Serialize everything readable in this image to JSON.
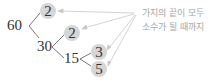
{
  "diagram": {
    "type": "factor-tree",
    "root": "60",
    "nodes": [
      {
        "id": "n60",
        "value": "60",
        "prime": false
      },
      {
        "id": "n2a",
        "value": "2",
        "prime": true,
        "parent": "n60"
      },
      {
        "id": "n30",
        "value": "30",
        "prime": false,
        "parent": "n60"
      },
      {
        "id": "n2b",
        "value": "2",
        "prime": true,
        "parent": "n30"
      },
      {
        "id": "n15",
        "value": "15",
        "prime": false,
        "parent": "n30"
      },
      {
        "id": "n3",
        "value": "3",
        "prime": true,
        "parent": "n15"
      },
      {
        "id": "n5",
        "value": "5",
        "prime": true,
        "parent": "n15"
      }
    ],
    "annotation": {
      "line1": "가지의 끝이 모두",
      "line2": "소수가 될 때까지"
    },
    "colors": {
      "prime_circle": "#d6d6d6",
      "text": "#333333",
      "branch": "#555555",
      "arrow": "#c8c8c8",
      "annotation": "#a8a8a8"
    }
  }
}
